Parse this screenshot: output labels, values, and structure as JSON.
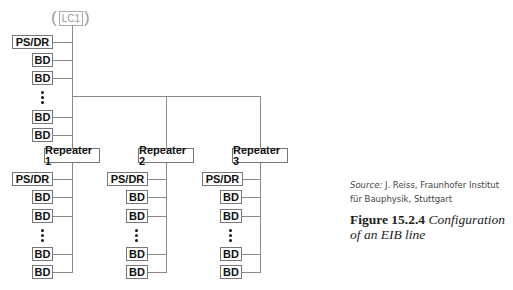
{
  "diagram": {
    "top": {
      "lc_label": "LC1",
      "paren_open": "(",
      "paren_close": ")",
      "devices": [
        "PS/DR",
        "BD",
        "BD",
        "BD",
        "BD"
      ]
    },
    "repeaters": [
      {
        "label": "Repeater 1",
        "devices": [
          "PS/DR",
          "BD",
          "BD",
          "BD",
          "BD"
        ]
      },
      {
        "label": "Repeater 2",
        "devices": [
          "PS/DR",
          "BD",
          "BD",
          "BD",
          "BD"
        ]
      },
      {
        "label": "Repeater 3",
        "devices": [
          "PS/DR",
          "BD",
          "BD",
          "BD",
          "BD"
        ]
      }
    ],
    "colors": {
      "line": "#8a8a8a",
      "box_border": "#777777",
      "lc_text": "#999999"
    }
  },
  "caption": {
    "source_label": "Source:",
    "source_text": " J. Reiss, Fraunhofer Institut für Bauphysik, Stuttgart",
    "figure_number": "Figure 15.2.4",
    "figure_title": " Configuration of an EIB line"
  }
}
